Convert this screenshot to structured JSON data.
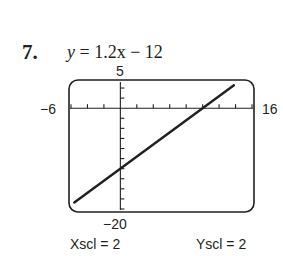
{
  "problem": {
    "number": "7.",
    "equation_lhs": "y",
    "equation_rhs": " = 1.2x − 12"
  },
  "window": {
    "xmin_label": "−6",
    "xmax_label": "16",
    "ymin_label": "−20",
    "ymax_label": "5",
    "xscl_label": "Xscl = 2",
    "yscl_label": "Yscl = 2"
  },
  "colors": {
    "line": "#231f20",
    "frame": "#231f20",
    "background": "#ffffff"
  },
  "chart_data": {
    "type": "line",
    "title": "y = 1.2x − 12",
    "xlabel": "",
    "ylabel": "",
    "xlim": [
      -6,
      16
    ],
    "ylim": [
      -20,
      5
    ],
    "xscl": 2,
    "yscl": 2,
    "grid": false,
    "series": [
      {
        "name": "y = 1.2x − 12",
        "x": [
          -6,
          0,
          10,
          14
        ],
        "values": [
          -19.2,
          -12,
          0,
          4.8
        ]
      }
    ]
  }
}
